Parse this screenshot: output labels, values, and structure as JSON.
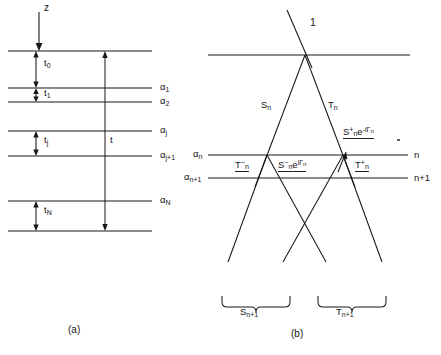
{
  "figure": {
    "domain": "scientific-diagram",
    "background": "#ffffff",
    "ink": "#181818",
    "width": 441,
    "height": 355,
    "captions": [
      {
        "id": "panel-a-caption",
        "text": "(a)",
        "x": 68,
        "y": 326
      },
      {
        "id": "panel-b-caption",
        "text": "(b)",
        "x": 291,
        "y": 330
      }
    ]
  },
  "panel_a": {
    "name": "layered-medium-stack",
    "axis_label": {
      "text": "z",
      "x": 44,
      "y": 8
    },
    "depth_arrow": {
      "x": 39,
      "y_start": 14,
      "y_end": 48
    },
    "interfaces": [
      {
        "label": "",
        "y": 51,
        "x_start": 8,
        "x_end": 152,
        "has_label": false
      },
      {
        "label": "α",
        "sub": "1",
        "y": 88,
        "x_start": 8,
        "x_end": 152,
        "has_label": true
      },
      {
        "label": "α",
        "sub": "2",
        "y": 102,
        "x_start": 8,
        "x_end": 152,
        "has_label": true
      },
      {
        "label": "α",
        "sub": "j",
        "y": 131,
        "x_start": 8,
        "x_end": 152,
        "has_label": true
      },
      {
        "label": "α",
        "sub": "j+1",
        "y": 156,
        "x_start": 8,
        "x_end": 152,
        "has_label": true
      },
      {
        "label": "α",
        "sub": "N",
        "y": 201,
        "x_start": 8,
        "x_end": 152,
        "has_label": true
      },
      {
        "label": "",
        "y": 231,
        "x_start": 8,
        "x_end": 152,
        "has_label": false
      }
    ],
    "thicknesses": [
      {
        "label": "t",
        "sub": "0",
        "x_arrow": 36,
        "y_top": 51,
        "y_bot": 88,
        "label_x": 44,
        "label_y": 63
      },
      {
        "label": "t",
        "sub": "1",
        "x_arrow": 36,
        "y_top": 88,
        "y_bot": 102,
        "label_x": 44,
        "label_y": 92
      },
      {
        "label": "t",
        "sub": "j",
        "x_arrow": 36,
        "y_top": 131,
        "y_bot": 156,
        "label_x": 44,
        "label_y": 139
      },
      {
        "label": "t",
        "sub": "N",
        "x_arrow": 36,
        "y_top": 201,
        "y_bot": 231,
        "label_x": 44,
        "label_y": 209
      }
    ],
    "total_thickness": {
      "label": "t",
      "x_arrow": 105,
      "y_top": 51,
      "y_bot": 231,
      "label_x": 110,
      "label_y": 139
    }
  },
  "panel_b": {
    "name": "ray-scattering-diagram",
    "incident_label": {
      "text": "1",
      "x": 310,
      "y": 22
    },
    "interfaces": [
      {
        "right_label": "",
        "y": 55,
        "x_start": 208,
        "x_end": 410,
        "has_label": false
      },
      {
        "left_label": "α",
        "left_sub": "n",
        "right_label": "n",
        "y": 155,
        "x_start": 208,
        "x_end": 408
      },
      {
        "left_label": "α",
        "left_sub": "n+1",
        "right_label": "n+1",
        "y": 178,
        "x_start": 208,
        "x_end": 408
      }
    ],
    "tick_dot": {
      "x": 398,
      "y": 140
    },
    "upper_labels": [
      {
        "id": "S-n",
        "base": "S",
        "sub": "n",
        "x": 263,
        "y": 105
      },
      {
        "id": "T-n",
        "base": "T",
        "sub": "n",
        "x": 330,
        "y": 105
      }
    ],
    "amplitude_labels": [
      {
        "id": "S-plus-n-exp",
        "text": "S⁺ₙe⁻ⁱΓₙ",
        "base": "S",
        "sup": "+",
        "sub": "n",
        "tail": "e",
        "tail_sup": "-iΓ",
        "tail_sub": "n",
        "x": 345,
        "y": 133,
        "underline": true
      },
      {
        "id": "T-minus-n",
        "base": "T",
        "sup": "−",
        "sub": "n",
        "x": 238,
        "y": 160,
        "underline": true
      },
      {
        "id": "S-minus-n-exp",
        "base": "S",
        "sup": "−",
        "sub": "n",
        "tail": "e",
        "tail_sup": "iΓ",
        "tail_sub": "n",
        "x": 283,
        "y": 160,
        "underline": true
      },
      {
        "id": "T-plus-n",
        "base": "T",
        "sup": "+",
        "sub": "n",
        "x": 357,
        "y": 160,
        "underline": true
      }
    ],
    "brace_labels": [
      {
        "id": "S-n-plus-1",
        "base": "S",
        "sub": "n+1",
        "x": 248,
        "y": 312
      },
      {
        "id": "T-n-plus-1",
        "base": "T",
        "sub": "n+1",
        "x": 340,
        "y": 312
      }
    ],
    "braces": [
      {
        "id": "brace-left",
        "x_left": 222,
        "x_right": 290,
        "y": 298
      },
      {
        "id": "brace-right",
        "x_left": 318,
        "x_right": 386,
        "y": 298
      }
    ]
  }
}
